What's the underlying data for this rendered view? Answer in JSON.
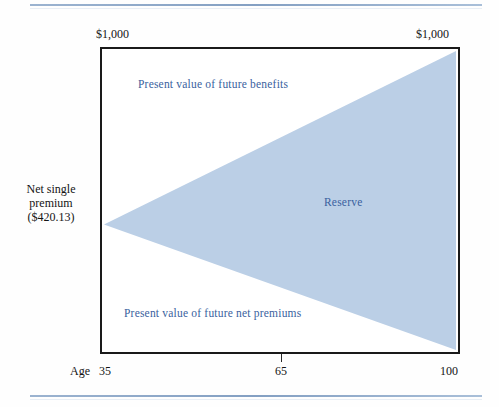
{
  "figure": {
    "caption_fragment": "",
    "type": "life-insurance-reserve-diagram"
  },
  "chart_data": {
    "type": "area",
    "xlabel": "Age",
    "ylabel": "",
    "x": [
      35,
      65,
      100
    ],
    "xlim": [
      35,
      100
    ],
    "xticks": [
      35,
      65,
      100
    ],
    "xtick_labels": [
      "35",
      "65",
      "100"
    ],
    "ylim": [
      0,
      1000
    ],
    "y_corner_values": [
      1000,
      1000
    ],
    "grid": false,
    "legend": "none",
    "annotations": [
      "Present value of future benefits",
      "Reserve",
      "Present value of future net premiums"
    ],
    "series": [
      {
        "name": "Present value of future benefits (upper boundary of reserve wedge)",
        "x": [
          35,
          100
        ],
        "values": [
          420.13,
          1000
        ]
      },
      {
        "name": "Present value of future net premiums (lower boundary of reserve wedge)",
        "x": [
          35,
          100
        ],
        "values": [
          420.13,
          0
        ]
      }
    ],
    "reserve_at_age_35": 0,
    "net_single_premium": 420.13,
    "face_amount": 1000,
    "wedge_fill_color": "#bbcfe6"
  },
  "axes": {
    "top_left_value": "$1,000",
    "top_right_value": "$1,000",
    "x_axis_name": "Age",
    "x_tick_labels": [
      "35",
      "65",
      "100"
    ]
  },
  "side_annotation": {
    "line1": "Net single",
    "line2": "premium",
    "line3": "($420.13)"
  },
  "plot_labels": {
    "benefits": "Present value of future benefits",
    "reserve": "Reserve",
    "premiums": "Present value of future net premiums"
  },
  "colors": {
    "wedge_fill": "#bbcfe6",
    "label_blue": "#3a5f9e",
    "frame": "#1a1a1a",
    "rule_blue": "#6e8fb8",
    "text": "#141414",
    "background": "#fefefe"
  }
}
